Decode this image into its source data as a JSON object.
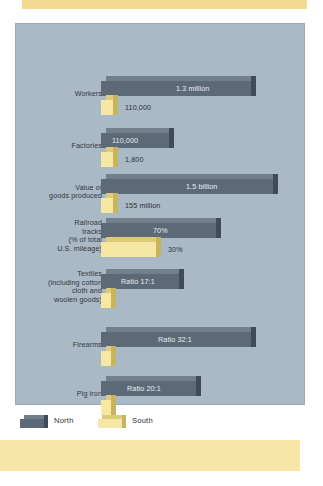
{
  "page": {
    "background_color": "#ffffff",
    "accent_band_color": "#f2db8e",
    "footer_band_color": "#f7e6a8"
  },
  "chart_panel": {
    "background_color": "#a9b9c5",
    "border_color": "#9aaab8"
  },
  "legend": {
    "items": [
      {
        "label": "North",
        "color": "#5c6a77",
        "swatch_name": "legend-swatch-north"
      },
      {
        "label": "South",
        "color": "#f6e7a4",
        "swatch_name": "legend-swatch-south"
      }
    ]
  },
  "chart_data": {
    "type": "bar",
    "title": "",
    "subtitle": "",
    "xlabel": "",
    "ylabel": "",
    "orientation": "horizontal",
    "grid": false,
    "legend_position": "bottom-left",
    "colors": {
      "North": "#5c6a77",
      "South": "#f6e7a4"
    },
    "categories": [
      "Workers",
      "Factories",
      "Value of goods produced",
      "Railroad tracks (% of total U.S. mileage)",
      "Textiles (including cotton cloth and woolen goods)",
      "Firearms",
      "Pig iron"
    ],
    "series": [
      {
        "name": "North",
        "labels": [
          "1.3 million",
          "110,000",
          "1.5 billion",
          "70%",
          "Ratio 17:1",
          "Ratio 32:1",
          "Ratio 20:1"
        ],
        "values": [
          1300000,
          110000,
          1500000000,
          70,
          17,
          32,
          20
        ]
      },
      {
        "name": "South",
        "labels": [
          "110,000",
          "1,800",
          "155 million",
          "30%",
          "",
          "",
          ""
        ],
        "values": [
          110000,
          1800,
          155000000,
          30,
          1,
          1,
          1
        ]
      }
    ],
    "rows": [
      {
        "label_lines": [
          "Workers"
        ],
        "label_top": 52,
        "north": {
          "value_text": "1.3 million",
          "bar_width": 150,
          "value_placement": "inside",
          "value_x": 75
        },
        "south": {
          "value_text": "110,000",
          "bar_width": 12,
          "value_placement": "outside",
          "value_x": 24
        }
      },
      {
        "label_lines": [
          "Factories"
        ],
        "label_top": 104,
        "north": {
          "value_text": "110,000",
          "bar_width": 68,
          "value_placement": "inside",
          "value_x": 11
        },
        "south": {
          "value_text": "1,800",
          "bar_width": 12,
          "value_placement": "outside",
          "value_x": 24
        }
      },
      {
        "label_lines": [
          "Value of",
          "goods produced"
        ],
        "label_top": 150,
        "north": {
          "value_text": "1.5 billion",
          "bar_width": 172,
          "value_placement": "inside",
          "value_x": 85
        },
        "south": {
          "value_text": "155 million",
          "bar_width": 12,
          "value_placement": "outside",
          "value_x": 24
        }
      },
      {
        "label_lines": [
          "Railroad",
          "tracks",
          "(% of total",
          "U.S. mileage)"
        ],
        "label_top": 194,
        "north": {
          "value_text": "70%",
          "bar_width": 115,
          "value_placement": "inside",
          "value_x": 52
        },
        "south": {
          "value_text": "30%",
          "bar_width": 55,
          "value_placement": "outside",
          "value_x": 67
        }
      },
      {
        "label_lines": [
          "Textiles",
          "(including cotton",
          "cloth and",
          "woolen goods)"
        ],
        "label_top": 245,
        "north": {
          "value_text": "Ratio 17:1",
          "bar_width": 78,
          "value_placement": "inside",
          "value_x": 20
        },
        "south": {
          "value_text": "",
          "bar_width": 10,
          "value_placement": "outside",
          "value_x": 22
        }
      },
      {
        "label_lines": [
          "Firearms"
        ],
        "label_top": 303,
        "north": {
          "value_text": "Ratio 32:1",
          "bar_width": 150,
          "value_placement": "inside",
          "value_x": 57
        },
        "south": {
          "value_text": "",
          "bar_width": 10,
          "value_placement": "outside",
          "value_x": 22
        }
      },
      {
        "label_lines": [
          "Pig iron"
        ],
        "label_top": 352,
        "north": {
          "value_text": "Ratio 20:1",
          "bar_width": 95,
          "value_placement": "inside",
          "value_x": 26
        },
        "south": {
          "value_text": "",
          "bar_width": 10,
          "value_placement": "outside",
          "value_x": 22
        }
      }
    ]
  }
}
